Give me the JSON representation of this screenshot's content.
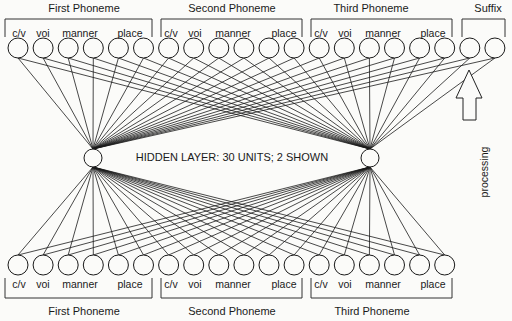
{
  "top": {
    "groups": [
      {
        "title": "First Phoneme",
        "labels": [
          "c/v",
          "voi",
          "manner",
          "place"
        ]
      },
      {
        "title": "Second Phoneme",
        "labels": [
          "c/v",
          "voi",
          "manner",
          "place"
        ]
      },
      {
        "title": "Third Phoneme",
        "labels": [
          "c/v",
          "voi",
          "manner",
          "place"
        ]
      },
      {
        "title": "Suffix",
        "labels": []
      }
    ],
    "unit_count": 20
  },
  "hidden": {
    "label": "HIDDEN LAYER: 30 UNITS; 2 SHOWN",
    "shown_units": 2
  },
  "bottom": {
    "groups": [
      {
        "title": "First Phoneme",
        "labels": [
          "c/v",
          "voi",
          "manner",
          "place"
        ]
      },
      {
        "title": "Second Phoneme",
        "labels": [
          "c/v",
          "voi",
          "manner",
          "place"
        ]
      },
      {
        "title": "Third Phoneme",
        "labels": [
          "c/v",
          "voi",
          "manner",
          "place"
        ]
      }
    ],
    "unit_count": 18
  },
  "arrow": {
    "label": "processing",
    "direction": "up"
  }
}
